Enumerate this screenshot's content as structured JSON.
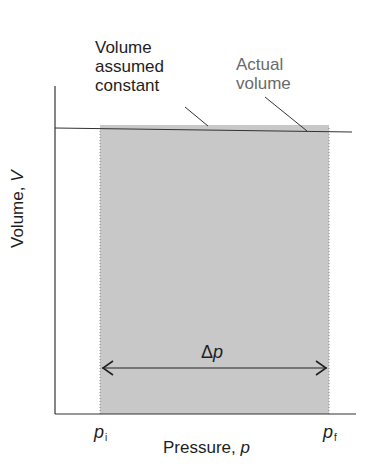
{
  "diagram": {
    "annotations": {
      "assumed": [
        "Volume",
        "assumed",
        "constant"
      ],
      "actual": [
        "Actual",
        "volume"
      ]
    },
    "axes": {
      "y_label_text": "Volume, ",
      "y_label_symbol": "V",
      "x_label_text": "Pressure, ",
      "x_label_symbol": "p"
    },
    "ticks": {
      "initial_symbol": "p",
      "initial_sub": "i",
      "final_symbol": "p",
      "final_sub": "f"
    },
    "interval": {
      "delta_symbol": "Δ",
      "delta_var": "p"
    },
    "colors": {
      "shaded_region": "#c8c8c8",
      "lines": "#333333",
      "actual_label": "#6a6a6a"
    }
  }
}
